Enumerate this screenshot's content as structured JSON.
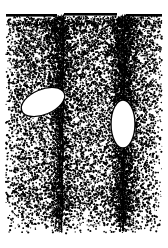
{
  "figure": {
    "title": "Stippled line-art cross-section of fractured rock",
    "caption": "",
    "width": 168,
    "height": 248,
    "background_color": "#ffffff",
    "ink_color": "#000000",
    "medium": "stipple pen-and-ink drawing",
    "labels": [],
    "axis_labels": [],
    "scale_bar": null
  },
  "chart_data": {
    "type": "scatter",
    "title": "Stippled line-art cross-section of fractured rock",
    "xlabel": "",
    "ylabel": "",
    "xlim": [
      0,
      168
    ],
    "ylim": [
      0,
      248
    ],
    "grid": false,
    "legend": "none",
    "stipple": {
      "dot_color": "#000000",
      "dot_radius_min": 0.45,
      "dot_radius_max": 1.15,
      "base_density": 0.016,
      "seed": 20240917,
      "field_left": 6,
      "field_right": 162,
      "field_top": 16,
      "field_bottom": 236,
      "fade_top_start": 16,
      "fade_top_full": 26,
      "fade_bottom_start": 186,
      "fade_bottom_end": 240,
      "edge_fade_left": 14,
      "edge_fade_right": 14,
      "crack_halo_width": 17,
      "crack_halo_gain": 4.2
    },
    "top_bands": [
      {
        "name": "top-band-left",
        "x": 6,
        "y": 14,
        "width": 51,
        "height": 2.6
      },
      {
        "name": "top-band-middle",
        "x": 64,
        "y": 13,
        "width": 53,
        "height": 2.6
      },
      {
        "name": "top-band-right",
        "x": 126,
        "y": 14,
        "width": 36,
        "height": 2.6
      }
    ],
    "cracks": [
      {
        "name": "fracture-left",
        "x_top": 63.5,
        "x_bottom": 62.0,
        "y_top": 15,
        "y_bottom": 232,
        "line_width": 1.5,
        "dark_side": "left",
        "wobble": 1.1
      },
      {
        "name": "fracture-right",
        "x_top": 124.5,
        "x_bottom": 123.0,
        "y_top": 15,
        "y_bottom": 230,
        "line_width": 1.6,
        "dark_side": "both",
        "wobble": 1.3
      }
    ],
    "lenses": [
      {
        "name": "lens-left",
        "cx": 43,
        "cy": 102,
        "rx": 23,
        "ry": 12.5,
        "rotation_deg": -23,
        "fill": "#ffffff",
        "stroke": "#000000",
        "stroke_width": 1.3
      },
      {
        "name": "lens-right",
        "cx": 123,
        "cy": 124,
        "rx": 12,
        "ry": 24,
        "rotation_deg": 0,
        "fill": "#ffffff",
        "stroke": "#000000",
        "stroke_width": 1.4
      }
    ]
  }
}
